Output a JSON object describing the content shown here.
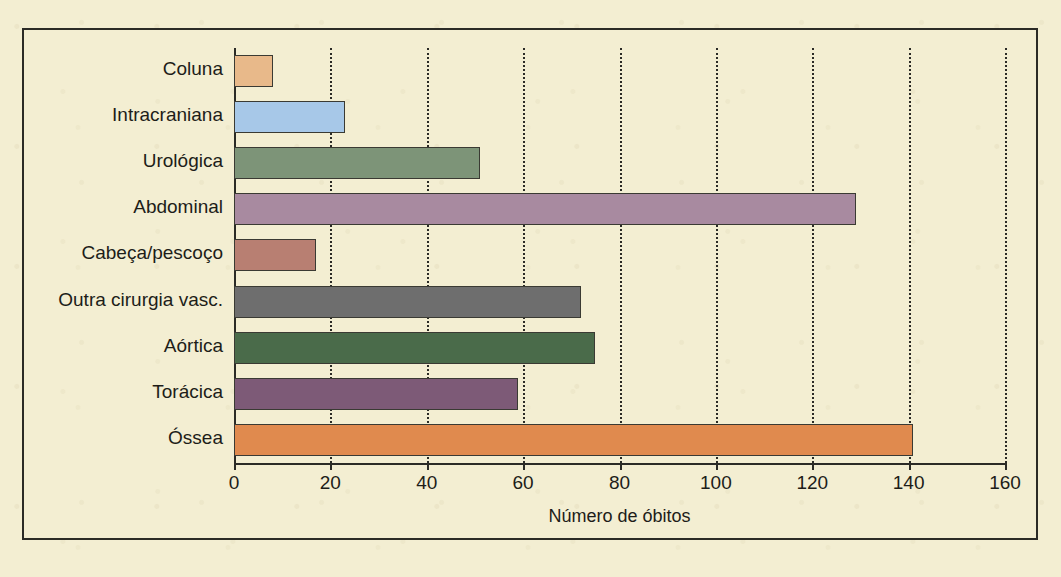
{
  "page": {
    "background_color": "#f3eed2",
    "frame_border_color": "#2b2b26"
  },
  "chart_data": {
    "type": "bar",
    "orientation": "horizontal",
    "title": "",
    "xlabel": "Número de óbitos",
    "ylabel": "",
    "xlim": [
      0,
      160
    ],
    "xticks": [
      0,
      20,
      40,
      60,
      80,
      100,
      120,
      140,
      160
    ],
    "grid": "vertical-dotted",
    "legend": "none",
    "categories": [
      "Coluna",
      "Intracraniana",
      "Urológica",
      "Abdominal",
      "Cabeça/pescoço",
      "Outra cirurgia vasc.",
      "Aórtica",
      "Torácica",
      "Óssea"
    ],
    "values": [
      8,
      23,
      51,
      129,
      17,
      72,
      75,
      59,
      141
    ],
    "colors": [
      "#e8b98a",
      "#a7c8e8",
      "#7d9478",
      "#a88aa0",
      "#b87f72",
      "#6e6e6e",
      "#4a6b4a",
      "#7d5a77",
      "#e08a4e"
    ],
    "bar_edge_color": "#3a3a33"
  },
  "ticks": {
    "t0": "0",
    "t20": "20",
    "t40": "40",
    "t60": "60",
    "t80": "80",
    "t100": "100",
    "t120": "120",
    "t140": "140",
    "t160": "160"
  },
  "bottom_caption": "",
  "bleed_text": {
    "b1": "",
    "b2": "",
    "b3": "",
    "b4": ""
  }
}
